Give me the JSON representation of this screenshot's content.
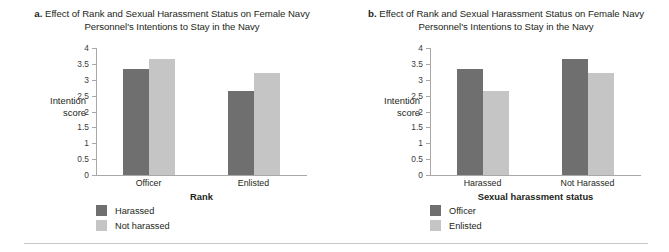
{
  "figure": {
    "background": "#ffffff",
    "rule_color": "#c9c9c9"
  },
  "colors": {
    "dark_gray": "#6f6f6f",
    "light_gray": "#c5c5c5",
    "axis": "#a8a8a8",
    "text": "#231f20"
  },
  "panels": [
    {
      "letter": "a.",
      "caption_line1": "Effect of Rank and Sexual Harassment Status on Female Navy",
      "caption_line2": "Personnel's Intentions to Stay in the Navy",
      "ylabel_line1": "Intention",
      "ylabel_line2": "score",
      "xlabel": "Rank",
      "legend": [
        {
          "label": "Harassed",
          "color": "#6f6f6f"
        },
        {
          "label": "Not harassed",
          "color": "#c5c5c5"
        }
      ],
      "chart_data": {
        "type": "bar",
        "title": "Effect of Rank and Sexual Harassment Status on Female Navy Personnel's Intentions to Stay in the Navy",
        "xlabel": "Rank",
        "ylabel": "Intention score",
        "ylim": [
          0,
          4
        ],
        "yticks": [
          "0",
          "0.5",
          "1",
          "1.5",
          "2",
          "2.5",
          "3",
          "3.5",
          "4"
        ],
        "ytick_values": [
          0,
          0.5,
          1,
          1.5,
          2,
          2.5,
          3,
          3.5,
          4
        ],
        "grid": false,
        "legend_position": "below-left",
        "categories": [
          "Officer",
          "Enlisted"
        ],
        "series": [
          {
            "name": "Harassed",
            "color": "#6f6f6f",
            "values": [
              3.33,
              2.65
            ]
          },
          {
            "name": "Not harassed",
            "color": "#c5c5c5",
            "values": [
              3.65,
              3.2
            ]
          }
        ]
      }
    },
    {
      "letter": "b.",
      "caption_line1": "Effect of Rank and Sexual Harassment Status on Female Navy",
      "caption_line2": "Personnel's Intentions to Stay in the Navy",
      "ylabel_line1": "Intention",
      "ylabel_line2": "score",
      "xlabel": "Sexual harassment status",
      "legend": [
        {
          "label": "Officer",
          "color": "#6f6f6f"
        },
        {
          "label": "Enlisted",
          "color": "#c5c5c5"
        }
      ],
      "chart_data": {
        "type": "bar",
        "title": "Effect of Rank and Sexual Harassment Status on Female Navy Personnel's Intentions to Stay in the Navy",
        "xlabel": "Sexual harassment status",
        "ylabel": "Intention score",
        "ylim": [
          0,
          4
        ],
        "yticks": [
          "0",
          "0.5",
          "1",
          "1.5",
          "2",
          "2.5",
          "3",
          "3.5",
          "4"
        ],
        "ytick_values": [
          0,
          0.5,
          1,
          1.5,
          2,
          2.5,
          3,
          3.5,
          4
        ],
        "grid": false,
        "legend_position": "below-left",
        "categories": [
          "Harassed",
          "Not Harassed"
        ],
        "series": [
          {
            "name": "Officer",
            "color": "#6f6f6f",
            "values": [
              3.33,
              3.65
            ]
          },
          {
            "name": "Enlisted",
            "color": "#c5c5c5",
            "values": [
              2.65,
              3.2
            ]
          }
        ]
      }
    }
  ]
}
